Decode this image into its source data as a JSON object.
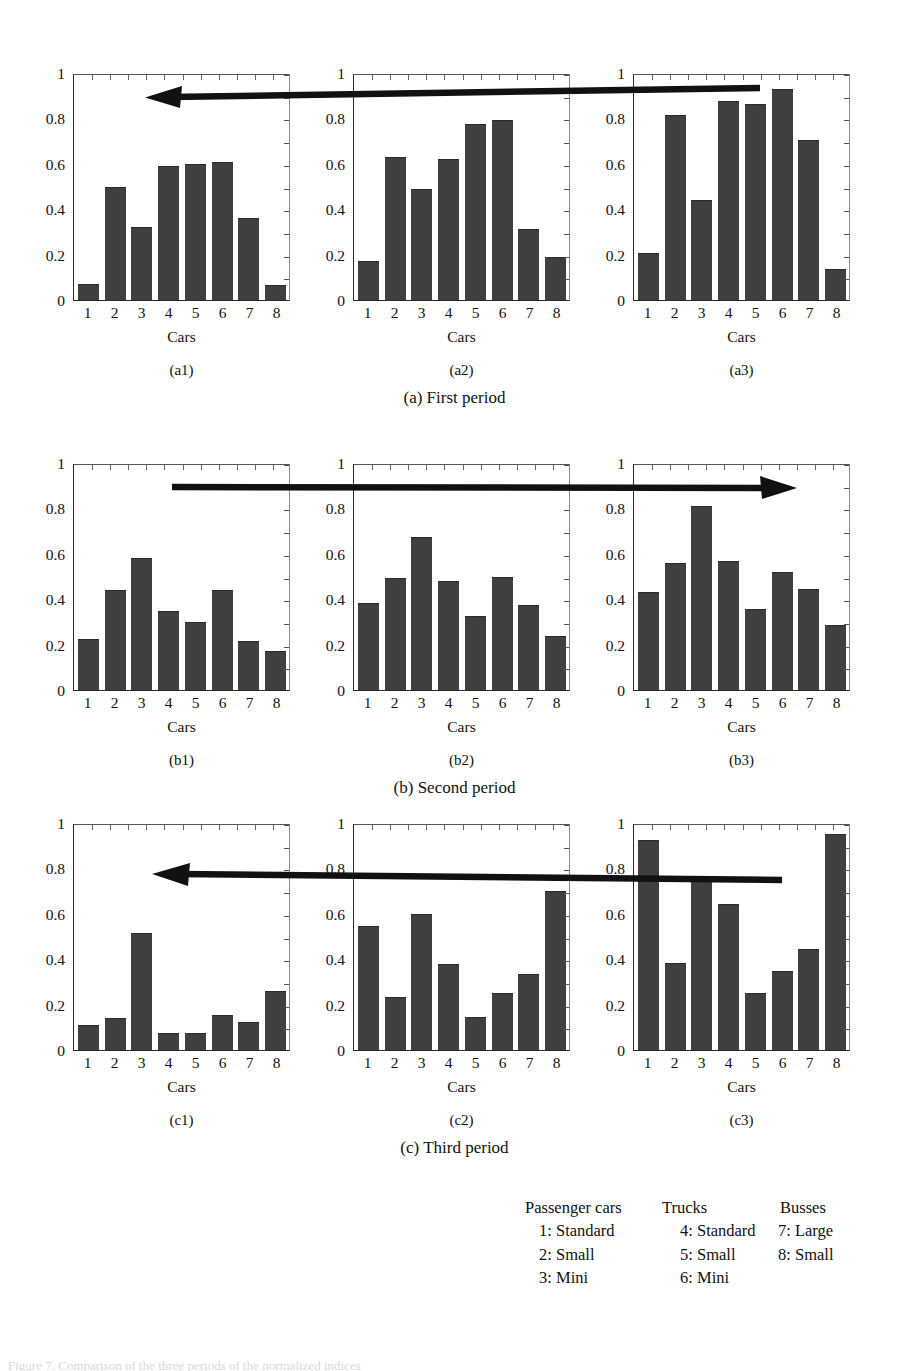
{
  "figure": {
    "bar_color": "#3f3f3f",
    "axis_color": "#2a2a2a",
    "background": "#ffffff",
    "x_axis_title": "Cars",
    "y_ticks": [
      "0",
      "0.2",
      "0.4",
      "0.6",
      "0.8",
      "1"
    ],
    "x_ticks": [
      "1",
      "2",
      "3",
      "4",
      "5",
      "6",
      "7",
      "8"
    ]
  },
  "rows": [
    {
      "caption": "(a) First period",
      "arrow_direction": "left"
    },
    {
      "caption": "(b) Second period",
      "arrow_direction": "right"
    },
    {
      "caption": "(c) Third period",
      "arrow_direction": "left"
    }
  ],
  "legend": {
    "headers": [
      "Passenger cars",
      "Trucks",
      "Busses"
    ],
    "col1": [
      "1: Standard",
      "2: Small",
      "3: Mini"
    ],
    "col2": [
      "4: Standard",
      "5: Small",
      "6: Mini"
    ],
    "col3": [
      "7: Large",
      "8: Small"
    ]
  },
  "bottom_caption": "Figure 7. Comparison of the three periods of the normalized indices",
  "chart_data": [
    {
      "type": "bar",
      "panel": "(a1)",
      "title": "",
      "xlabel": "Cars",
      "ylabel": "",
      "categories": [
        "1",
        "2",
        "3",
        "4",
        "5",
        "6",
        "7",
        "8"
      ],
      "values": [
        0.07,
        0.5,
        0.32,
        0.59,
        0.6,
        0.61,
        0.36,
        0.065
      ],
      "ylim": [
        0,
        1
      ],
      "yticks": [
        0,
        0.2,
        0.4,
        0.6,
        0.8,
        1
      ],
      "grid": false,
      "legend": "none"
    },
    {
      "type": "bar",
      "panel": "(a2)",
      "title": "",
      "xlabel": "Cars",
      "ylabel": "",
      "categories": [
        "1",
        "2",
        "3",
        "4",
        "5",
        "6",
        "7",
        "8"
      ],
      "values": [
        0.17,
        0.63,
        0.49,
        0.62,
        0.775,
        0.795,
        0.315,
        0.19
      ],
      "ylim": [
        0,
        1
      ],
      "yticks": [
        0,
        0.2,
        0.4,
        0.6,
        0.8,
        1
      ],
      "grid": false,
      "legend": "none"
    },
    {
      "type": "bar",
      "panel": "(a3)",
      "title": "",
      "xlabel": "Cars",
      "ylabel": "",
      "categories": [
        "1",
        "2",
        "3",
        "4",
        "5",
        "6",
        "7",
        "8"
      ],
      "values": [
        0.205,
        0.815,
        0.44,
        0.875,
        0.865,
        0.93,
        0.705,
        0.135
      ],
      "ylim": [
        0,
        1
      ],
      "yticks": [
        0,
        0.2,
        0.4,
        0.6,
        0.8,
        1
      ],
      "grid": false,
      "legend": "none"
    },
    {
      "type": "bar",
      "panel": "(b1)",
      "title": "",
      "xlabel": "Cars",
      "ylabel": "",
      "categories": [
        "1",
        "2",
        "3",
        "4",
        "5",
        "6",
        "7",
        "8"
      ],
      "values": [
        0.225,
        0.44,
        0.58,
        0.35,
        0.3,
        0.44,
        0.215,
        0.17
      ],
      "ylim": [
        0,
        1
      ],
      "yticks": [
        0,
        0.2,
        0.4,
        0.6,
        0.8,
        1
      ],
      "grid": false,
      "legend": "none"
    },
    {
      "type": "bar",
      "panel": "(b2)",
      "title": "",
      "xlabel": "Cars",
      "ylabel": "",
      "categories": [
        "1",
        "2",
        "3",
        "4",
        "5",
        "6",
        "7",
        "8"
      ],
      "values": [
        0.385,
        0.495,
        0.675,
        0.48,
        0.325,
        0.5,
        0.375,
        0.24
      ],
      "ylim": [
        0,
        1
      ],
      "yticks": [
        0,
        0.2,
        0.4,
        0.6,
        0.8,
        1
      ],
      "grid": false,
      "legend": "none"
    },
    {
      "type": "bar",
      "panel": "(b3)",
      "title": "",
      "xlabel": "Cars",
      "ylabel": "",
      "categories": [
        "1",
        "2",
        "3",
        "4",
        "5",
        "6",
        "7",
        "8"
      ],
      "values": [
        0.43,
        0.56,
        0.81,
        0.57,
        0.355,
        0.52,
        0.445,
        0.285
      ],
      "ylim": [
        0,
        1
      ],
      "yticks": [
        0,
        0.2,
        0.4,
        0.6,
        0.8,
        1
      ],
      "grid": false,
      "legend": "none"
    },
    {
      "type": "bar",
      "panel": "(c1)",
      "title": "",
      "xlabel": "Cars",
      "ylabel": "",
      "categories": [
        "1",
        "2",
        "3",
        "4",
        "5",
        "6",
        "7",
        "8"
      ],
      "values": [
        0.11,
        0.14,
        0.515,
        0.075,
        0.075,
        0.155,
        0.125,
        0.26
      ],
      "ylim": [
        0,
        1
      ],
      "yticks": [
        0,
        0.2,
        0.4,
        0.6,
        0.8,
        1
      ],
      "grid": false,
      "legend": "none"
    },
    {
      "type": "bar",
      "panel": "(c2)",
      "title": "",
      "xlabel": "Cars",
      "ylabel": "",
      "categories": [
        "1",
        "2",
        "3",
        "4",
        "5",
        "6",
        "7",
        "8"
      ],
      "values": [
        0.545,
        0.235,
        0.6,
        0.38,
        0.145,
        0.25,
        0.335,
        0.7
      ],
      "ylim": [
        0,
        1
      ],
      "yticks": [
        0,
        0.2,
        0.4,
        0.6,
        0.8,
        1
      ],
      "grid": false,
      "legend": "none"
    },
    {
      "type": "bar",
      "panel": "(c3)",
      "title": "",
      "xlabel": "Cars",
      "ylabel": "",
      "categories": [
        "1",
        "2",
        "3",
        "4",
        "5",
        "6",
        "7",
        "8"
      ],
      "values": [
        0.925,
        0.385,
        0.755,
        0.645,
        0.25,
        0.35,
        0.445,
        0.95
      ],
      "ylim": [
        0,
        1
      ],
      "yticks": [
        0,
        0.2,
        0.4,
        0.6,
        0.8,
        1
      ],
      "grid": false,
      "legend": "none"
    }
  ]
}
